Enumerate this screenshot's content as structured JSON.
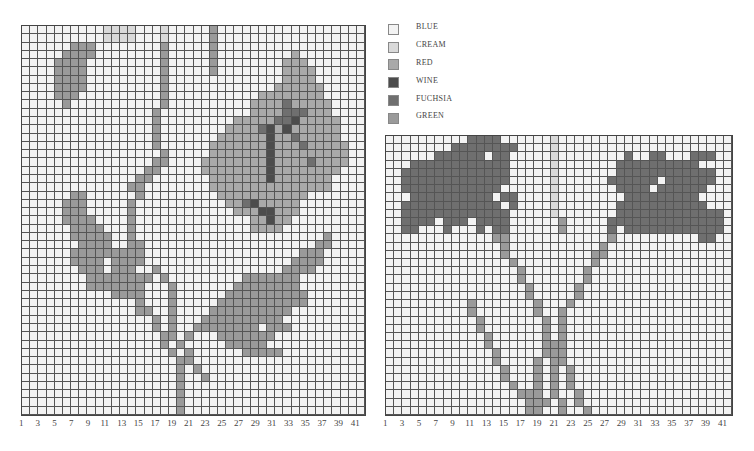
{
  "legend": [
    {
      "code": ".",
      "label": "BLUE",
      "color": "#f3f3f3"
    },
    {
      "code": "c",
      "label": "CREAM",
      "color": "#d9d9d9"
    },
    {
      "code": "r",
      "label": "RED",
      "color": "#a9a9a9"
    },
    {
      "code": "w",
      "label": "WINE",
      "color": "#4c4c4c"
    },
    {
      "code": "f",
      "label": "FUCHSIA",
      "color": "#6f6f6f"
    },
    {
      "code": "g",
      "label": "GREEN",
      "color": "#9a9a9a"
    }
  ],
  "left_chart": {
    "columns": 42,
    "rows": 47,
    "x_labels": [
      "1",
      "",
      "3",
      "",
      "5",
      "",
      "7",
      "",
      "9",
      "",
      "11",
      "",
      "13",
      "",
      "15",
      "",
      "17",
      "",
      "19",
      "",
      "21",
      "",
      "23",
      "",
      "25",
      "",
      "27",
      "",
      "29",
      "",
      "31",
      "",
      "33",
      "",
      "35",
      "",
      "37",
      "",
      "39",
      "",
      "41",
      ""
    ],
    "grid": [
      "..........cccc...c.....g..................",
      "..........cccc...c.....g..................",
      "......ggg........g.....g..................",
      ".....gggg........g.....g.........r........",
      "....gggg.........g.....g........rrr.......",
      "....gggg.........g.....g........rrrr......",
      "....gggg.........g..............rrrr......",
      "....gggg.........g.............rrrrrr.....",
      "....ggg..........g...........rrrrrrrr.....",
      ".....g...........g..........rrrrfrrrrr....",
      "................g...........rrrrfffrrr....",
      "................g.........rrrrrffwrrrrr...",
      "................g........rrrrfwrwrrrrrr...",
      "................g.......rrrrrrwrrfrrrrr...",
      "................g......rrrrrrrwrrrfrrrrr..",
      ".................g.....rrrrrrrwrrrrrrrrr..",
      "................gg....rrrrrrrrwrrrrfrrrr..",
      "...............gg.....rrrrrrrrwrrrrrrrr...",
      "..............gg.......rrrrrrrwrrrrrrr....",
      ".............gg........rrrrrrrrrrrrrrr....",
      "......gg......g.........rrrrrrrrrrr.......",
      ".....ggg.....g...........rrfwrrrrr........",
      ".....ggg.....g............rrrwwrrr........",
      ".....gggg....g..............rrwrr.........",
      "......gggg...g..............rrrr..........",
      "......ggggg..g.......................g....",
      ".......gggg..gg.....................gg....",
      "......ggggggggg...................ggg.....",
      "......gggg.gggg..................gggg.....",
      ".......ggg.ggg..g...............gggg......",
      "........gggggggg.g.........ggggggg........",
      "........ggggggg...g.......gggggggg........",
      "...........gggg...g......gggggggggg.......",
      "..............g...g.....ggggggggggg.......",
      "..............gg..g....gggggggggg.........",
      "................g.g...gggggggggg..........",
      "................g.g..gggggggg.ggg.........",
      ".................gg.g...ggggggg...........",
      ".................g.g.....ggggg............",
      "..................g.g......ggggg..........",
      "...................gg.....................",
      "...................g.g....................",
      "...................g..g...................",
      "...................g......................",
      "...................g......................",
      "...................g......................",
      "...................g......................"
    ]
  },
  "right_chart": {
    "columns": 42,
    "rows": 34,
    "x_labels": [
      "1",
      "",
      "3",
      "",
      "5",
      "",
      "7",
      "",
      "9",
      "",
      "11",
      "",
      "13",
      "",
      "15",
      "",
      "17",
      "",
      "19",
      "",
      "21",
      "",
      "23",
      "",
      "25",
      "",
      "27",
      "",
      "29",
      "",
      "31",
      "",
      "33",
      "",
      "35",
      "",
      "37",
      "",
      "39",
      "",
      "41",
      ""
    ],
    "grid": [
      "..........ffff......c.....................",
      "........ffffffff....c.....................",
      "......ffffff.ff.....c........f..ff...fff..",
      "...ffffffffffff.....c.......ffffffffff....",
      "..fffffffffffff.....c.......ffffffffffff..",
      "..fffffffffffff.....c......ffffff.ffffff..",
      "..ffffffffffff......c.......ffff.ffffff...",
      "...ffffffffff.ff....c........fffffffff....",
      "..ffffffffffff.f....c.......fffffffffff...",
      "..fffffffffffff.....c.......fffffffffffff.",
      "..ffff.fff.ffff......g.....ffffffffffffff.",
      "..ff...f...f.ff......g.....f.ffffffffffff.",
      ".............gg............g..........ff..",
      "..............g...........g...............",
      "..............g..........gg...............",
      "...............g.........g................",
      "................g.......g.................",
      "................g.......g.................",
      ".................g.....g..................",
      ".................g.....g..................",
      "..........g.......g...g...................",
      "..........g.......g..g....................",
      "...........g.......g.g....................",
      "...........g.......g.g....................",
      "............g......g.g....................",
      "............g......ggg....................",
      ".............g.....ggg....................",
      ".............g....g.gg....................",
      "..............g...g.g.g...................",
      "..............g...g.g.g...................",
      "...............g..g.g.g...................",
      "................ggg.g..g..................",
      ".................ggg.g.g..................",
      ".................gg..g..g................."
    ]
  }
}
